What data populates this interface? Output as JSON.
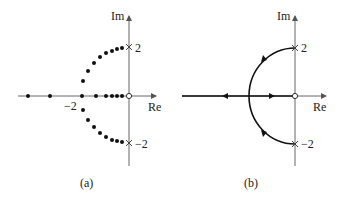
{
  "panel_a": {
    "caption": "(a)",
    "im_label": "Im",
    "re_label": "Re",
    "tick_pos": "2",
    "tick_neg": "−2",
    "tick_re": "−2",
    "description": "Discrete closed-loop pole locations (dots) for increasing gain"
  },
  "panel_b": {
    "caption": "(b)",
    "im_label": "Im",
    "re_label": "Re",
    "tick_pos": "2",
    "tick_neg": "−2",
    "description": "Continuous root locus with direction arrows"
  },
  "legend": {
    "pole_marker": "x",
    "zero_marker": "o"
  }
}
